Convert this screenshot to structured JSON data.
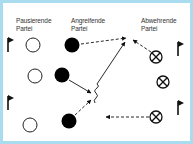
{
  "diagram": {
    "border_color": "#a9dcef",
    "labels": {
      "resting": [
        "Pausierende",
        "Partei"
      ],
      "attacking": [
        "Angreifende",
        "Partei"
      ],
      "defending": [
        "Abwehrende",
        "Partei"
      ]
    },
    "players": {
      "resting": [
        {
          "x": 33,
          "y": 45
        },
        {
          "x": 35,
          "y": 76
        },
        {
          "x": 30,
          "y": 125
        }
      ],
      "attacking": [
        {
          "x": 72,
          "y": 45
        },
        {
          "x": 62,
          "y": 75
        },
        {
          "x": 69,
          "y": 121
        }
      ],
      "defending": [
        {
          "x": 156,
          "y": 57
        },
        {
          "x": 163,
          "y": 82
        },
        {
          "x": 156,
          "y": 117
        }
      ]
    },
    "flags": [
      {
        "x": 8,
        "y": 40
      },
      {
        "x": 8,
        "y": 98
      },
      {
        "x": 178,
        "y": 44
      },
      {
        "x": 178,
        "y": 103
      }
    ],
    "arrows": [
      {
        "type": "dashed",
        "from": "attacking-1",
        "to": "target-top"
      },
      {
        "type": "solid",
        "from": "attacking-2",
        "to": "center"
      },
      {
        "type": "wavy-dribble",
        "from": "center",
        "to": "target-top"
      },
      {
        "type": "dashed",
        "from": "attacking-3",
        "to": "center"
      },
      {
        "type": "dashed",
        "from": "defending-1",
        "to": "target-top"
      },
      {
        "type": "dashed",
        "from": "defending-3",
        "to": "left"
      }
    ]
  }
}
